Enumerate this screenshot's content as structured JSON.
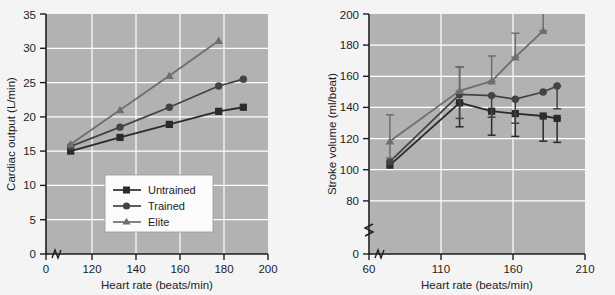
{
  "figure": {
    "background": "#f4f4f5",
    "plot_background": "#b2b2b2",
    "gridline_color": "#ffffff",
    "axis_color": "#1d1d1d"
  },
  "series_style": {
    "untrained": {
      "color": "#2b2b2b",
      "marker": "square"
    },
    "trained": {
      "color": "#434343",
      "marker": "circle"
    },
    "elite": {
      "color": "#6e6e6e",
      "marker": "triangle"
    }
  },
  "legend": {
    "position": "lower-left-of-left-panel",
    "items": [
      {
        "label": "Untrained",
        "marker": "square",
        "color": "#2b2b2b"
      },
      {
        "label": "Trained",
        "marker": "circle",
        "color": "#434343"
      },
      {
        "label": "Elite",
        "marker": "triangle",
        "color": "#6e6e6e"
      }
    ]
  },
  "chart_data": [
    {
      "id": "cardiac-output",
      "type": "line",
      "title": "",
      "xlabel": "Heart rate (beats/min)",
      "ylabel": "Cardiac output (L/min)",
      "xlim": [
        110,
        200
      ],
      "ylim": [
        0,
        35
      ],
      "xticks": [
        0,
        120,
        140,
        160,
        180,
        200
      ],
      "yticks": [
        0,
        5,
        10,
        15,
        20,
        25,
        30,
        35
      ],
      "axis_break_x": true,
      "grid": true,
      "series": [
        {
          "name": "Untrained",
          "x": [
            120,
            140,
            160,
            180,
            190
          ],
          "values": [
            15.0,
            17.0,
            18.9,
            20.8,
            21.4
          ]
        },
        {
          "name": "Trained",
          "x": [
            120,
            140,
            160,
            180,
            190
          ],
          "values": [
            15.7,
            18.5,
            21.4,
            24.5,
            25.5
          ]
        },
        {
          "name": "Elite",
          "x": [
            120,
            140,
            160,
            180
          ],
          "values": [
            16.0,
            21.0,
            26.0,
            31.1
          ]
        }
      ]
    },
    {
      "id": "stroke-volume",
      "type": "line",
      "title": "",
      "xlabel": "Heart rate (beats/min)",
      "ylabel": "Stroke volume (ml/beat)",
      "xlim": [
        55,
        210
      ],
      "ylim": [
        0,
        200
      ],
      "xticks": [
        60,
        110,
        160,
        210
      ],
      "yticks": [
        0,
        80,
        100,
        120,
        140,
        160,
        180,
        200
      ],
      "axis_break_x": true,
      "axis_break_y": true,
      "grid": true,
      "error_bars": true,
      "series": [
        {
          "name": "Untrained",
          "x": [
            70,
            120,
            143,
            160,
            180,
            190
          ],
          "values": [
            74,
            126,
            119,
            117,
            115,
            113
          ],
          "err_low": [
            74,
            106,
            99,
            98,
            94,
            93
          ],
          "err_high": [
            74,
            126,
            119,
            117,
            115,
            113
          ]
        },
        {
          "name": "Trained",
          "x": [
            70,
            120,
            143,
            160,
            180,
            190
          ],
          "values": [
            77,
            133,
            132,
            129,
            135,
            140
          ],
          "err_low": [
            77,
            113,
            114,
            109,
            135,
            121
          ],
          "err_high": [
            77,
            156,
            132,
            129,
            135,
            140
          ]
        },
        {
          "name": "Elite",
          "x": [
            70,
            120,
            143,
            160,
            180
          ],
          "values": [
            94,
            136,
            144,
            164,
            186
          ],
          "err_low": [
            80,
            136,
            144,
            164,
            186
          ],
          "err_high": [
            116,
            156,
            165,
            184,
            205
          ]
        }
      ]
    }
  ]
}
